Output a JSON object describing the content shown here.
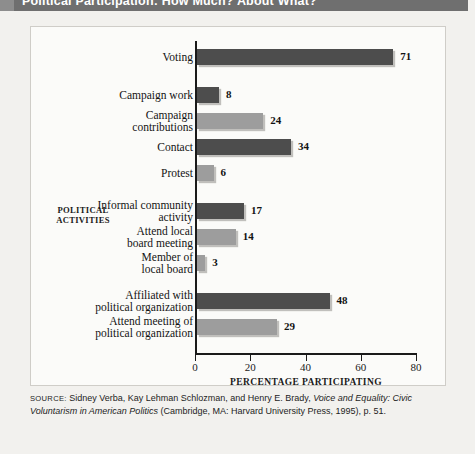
{
  "figure": {
    "title": "Political Participation: How Much? About What?",
    "source_label": "SOURCE:",
    "source_text_1": " Sidney Verba, Kay Lehman Schlozman, and Henry E. Brady, ",
    "source_italic_1": "Voice and Equality: Civic Voluntarism in American Politics",
    "source_text_2": " (Cambridge, MA: Harvard University Press, 1995), p. 51."
  },
  "chart_data": {
    "type": "bar",
    "orientation": "horizontal",
    "title": "Political Participation: How Much? About What?",
    "xlabel": "PERCENTAGE PARTICIPATING",
    "ylabel": "POLITICAL ACTIVITIES",
    "xlim": [
      0,
      80
    ],
    "xticks": [
      0,
      20,
      40,
      60,
      80
    ],
    "grid": false,
    "legend": false,
    "categories": [
      "Voting",
      "Campaign work",
      "Campaign\ncontributions",
      "Contact",
      "Protest",
      "Informal community\nactivity",
      "Attend local\nboard meeting",
      "Member of\nlocal board",
      "Affiliated with\npolitical organization",
      "Attend meeting of\npolitical organization"
    ],
    "values": [
      71,
      8,
      24,
      34,
      6,
      17,
      14,
      3,
      48,
      29
    ],
    "bar_colors": [
      "dark",
      "dark",
      "light",
      "dark",
      "light",
      "dark",
      "light",
      "light",
      "dark",
      "light"
    ],
    "colors": {
      "dark": "#4d4d4d",
      "light": "#9d9d9d",
      "banner": "#6f6f6f",
      "panel": "#fbfbf9",
      "page": "#f2f1ee"
    }
  }
}
